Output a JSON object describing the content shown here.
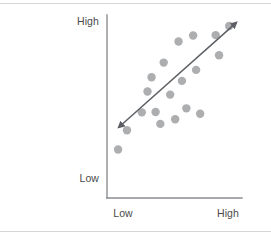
{
  "figure": {
    "width": 271,
    "height": 238,
    "background": "#ffffff",
    "rule_color": "#d4d6d8"
  },
  "axes": {
    "color": "#8a8d90",
    "x_axis": {
      "x1": 107,
      "y1": 198,
      "x2": 242,
      "y2": 198
    },
    "y_axis": {
      "x1": 107,
      "y1": 15,
      "x2": 107,
      "y2": 198
    },
    "y_label_high": "High",
    "y_label_low": "Low",
    "x_label_low": "Low",
    "x_label_high": "High",
    "label_color": "#4a4a4a"
  },
  "chart_data": {
    "type": "scatter",
    "title": "",
    "xlabel": "",
    "ylabel": "",
    "xtick_labels": [
      "Low",
      "High"
    ],
    "ytick_labels": [
      "Low",
      "High"
    ],
    "xlim": [
      0,
      1
    ],
    "ylim": [
      0,
      1
    ],
    "grid": false,
    "legend": null,
    "marker_color": "#adaeb0",
    "marker_radius": 4.2,
    "points": [
      {
        "x": 0.082,
        "y": 0.265
      },
      {
        "x": 0.148,
        "y": 0.37
      },
      {
        "x": 0.258,
        "y": 0.468
      },
      {
        "x": 0.3,
        "y": 0.582
      },
      {
        "x": 0.33,
        "y": 0.66
      },
      {
        "x": 0.36,
        "y": 0.47
      },
      {
        "x": 0.395,
        "y": 0.405
      },
      {
        "x": 0.42,
        "y": 0.74
      },
      {
        "x": 0.468,
        "y": 0.565
      },
      {
        "x": 0.505,
        "y": 0.43
      },
      {
        "x": 0.53,
        "y": 0.855
      },
      {
        "x": 0.555,
        "y": 0.64
      },
      {
        "x": 0.588,
        "y": 0.49
      },
      {
        "x": 0.638,
        "y": 0.888
      },
      {
        "x": 0.66,
        "y": 0.7
      },
      {
        "x": 0.69,
        "y": 0.46
      },
      {
        "x": 0.805,
        "y": 0.89
      },
      {
        "x": 0.83,
        "y": 0.78
      },
      {
        "x": 0.905,
        "y": 0.94
      }
    ],
    "trendline": {
      "type": "double-arrow",
      "color": "#5c5f63",
      "x_start": 0.085,
      "y_start": 0.385,
      "x_end": 0.96,
      "y_end": 0.96
    }
  }
}
